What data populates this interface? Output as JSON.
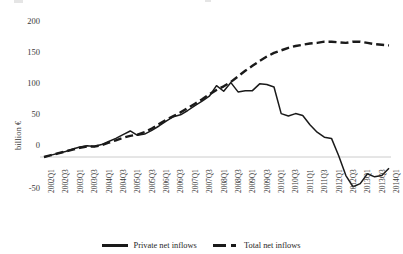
{
  "chart_data": {
    "type": "line",
    "title": "",
    "xlabel": "",
    "ylabel": "billion €",
    "ylim": [
      -50,
      200
    ],
    "yticks": [
      -50,
      0,
      50,
      100,
      150,
      200
    ],
    "grid": false,
    "legend_position": "bottom",
    "categories": [
      "2002Q1",
      "2002Q2",
      "2002Q3",
      "2002Q4",
      "2003Q1",
      "2003Q2",
      "2003Q3",
      "2003Q4",
      "2004Q1",
      "2004Q2",
      "2004Q3",
      "2004Q4",
      "2005Q1",
      "2005Q2",
      "2005Q3",
      "2005Q4",
      "2006Q1",
      "2006Q2",
      "2006Q3",
      "2006Q4",
      "2007Q1",
      "2007Q2",
      "2007Q3",
      "2007Q4",
      "2008Q1",
      "2008Q2",
      "2008Q3",
      "2008Q4",
      "2009Q1",
      "2009Q2",
      "2009Q3",
      "2009Q4",
      "2010Q1",
      "2010Q2",
      "2010Q3",
      "2010Q4",
      "2011Q1",
      "2011Q2",
      "2011Q3",
      "2011Q4",
      "2012Q1",
      "2012Q2",
      "2012Q3",
      "2012Q4",
      "2013Q1",
      "2013Q2",
      "2013Q3",
      "2013Q4",
      "2014Q1"
    ],
    "tick_labels": [
      "2002Q1",
      "2002Q3",
      "2003Q1",
      "2003Q3",
      "2004Q1",
      "2004Q3",
      "2005Q1",
      "2005Q3",
      "2006Q1",
      "2006Q3",
      "2007Q1",
      "2007Q3",
      "2008Q1",
      "2008Q3",
      "2009Q1",
      "2009Q3",
      "2010Q1",
      "2010Q3",
      "2011Q1",
      "2011Q3",
      "2012Q1",
      "2012Q3",
      "2013Q1",
      "2013Q3",
      "2014Q1"
    ],
    "series": [
      {
        "name": "Private net inflows",
        "style": "solid",
        "color": "#1a1a1a",
        "values": [
          0,
          3,
          6,
          9,
          13,
          16,
          18,
          17,
          20,
          25,
          30,
          36,
          42,
          35,
          37,
          43,
          50,
          58,
          65,
          68,
          75,
          83,
          90,
          98,
          115,
          106,
          120,
          105,
          107,
          107,
          118,
          117,
          113,
          70,
          66,
          70,
          67,
          52,
          40,
          32,
          30,
          2,
          -30,
          -48,
          -43,
          -27,
          -32,
          -30,
          -18
        ]
      },
      {
        "name": "Total net inflows",
        "style": "dashed",
        "color": "#1a1a1a",
        "values": [
          0,
          3,
          6,
          9,
          12,
          15,
          17,
          17,
          19,
          23,
          27,
          31,
          34,
          36,
          40,
          46,
          53,
          60,
          66,
          72,
          79,
          86,
          93,
          101,
          108,
          114,
          121,
          130,
          139,
          147,
          155,
          162,
          168,
          172,
          176,
          179,
          181,
          183,
          184,
          186,
          186,
          185,
          184,
          186,
          186,
          184,
          182,
          181,
          180
        ]
      }
    ]
  },
  "legend": {
    "items": [
      {
        "label": "Private net inflows",
        "style": "solid"
      },
      {
        "label": "Total net inflows",
        "style": "dashed"
      }
    ]
  }
}
